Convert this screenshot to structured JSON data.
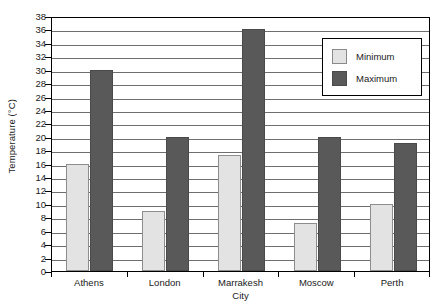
{
  "chart_data": {
    "type": "bar",
    "title": "",
    "xlabel": "City",
    "ylabel": "Temperature (°C)",
    "categories": [
      "Athens",
      "London",
      "Marrakesh",
      "Moscow",
      "Perth"
    ],
    "series": [
      {
        "name": "Minimum",
        "color": "#e3e3e3",
        "values": [
          16,
          9,
          17.3,
          7.2,
          10
        ]
      },
      {
        "name": "Maximum",
        "color": "#595959",
        "values": [
          30,
          20,
          36,
          20,
          19.1
        ]
      }
    ],
    "ylim": [
      0,
      38
    ],
    "ytick_step": 2,
    "yticks": [
      0,
      2,
      4,
      6,
      8,
      10,
      12,
      14,
      16,
      18,
      20,
      22,
      24,
      26,
      28,
      30,
      32,
      34,
      36,
      38
    ],
    "ytick_labels": [
      "0",
      "2",
      "4",
      "6",
      "8",
      "10",
      "12",
      "14",
      "16",
      "18",
      "20",
      "22",
      "24",
      "26",
      "28",
      "30",
      "32",
      "34",
      "36",
      "38"
    ],
    "grid": true,
    "grid_axis": "y",
    "legend_position": "upper right",
    "legend_entries": [
      "Minimum",
      "Maximum"
    ],
    "background_color": "#ffffff",
    "frame_color": "#000000",
    "gridline_color": "#6e6e6e"
  }
}
